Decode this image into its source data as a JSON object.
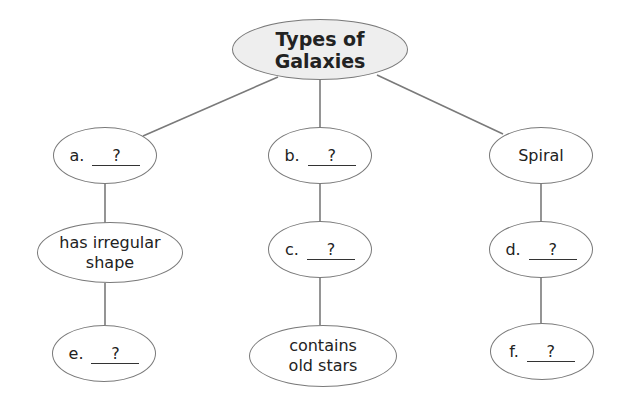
{
  "diagram": {
    "title": "Types of Galaxies",
    "line_color": "#7a7a7a",
    "root_fill": "#eeeeee",
    "columns": [
      {
        "level1": {
          "letter": "a.",
          "answer": "?"
        },
        "level2": {
          "text": "has irregular shape",
          "lines": [
            "has irregular",
            "shape"
          ]
        },
        "level3": {
          "letter": "e.",
          "answer": "?"
        }
      },
      {
        "level1": {
          "letter": "b.",
          "answer": "?"
        },
        "level2": {
          "letter": "c.",
          "answer": "?"
        },
        "level3": {
          "text": "contains old stars",
          "lines": [
            "contains",
            "old stars"
          ]
        }
      },
      {
        "level1": {
          "text": "Spiral"
        },
        "level2": {
          "letter": "d.",
          "answer": "?"
        },
        "level3": {
          "letter": "f.",
          "answer": "?"
        }
      }
    ]
  }
}
